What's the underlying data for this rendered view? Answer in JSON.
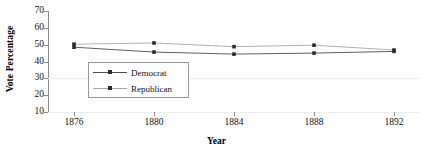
{
  "chart_data": {
    "type": "line",
    "title": "",
    "xlabel": "Year",
    "ylabel": "Vote Percentage",
    "x": [
      1876,
      1880,
      1884,
      1888,
      1892
    ],
    "categories": [
      "1876",
      "1880",
      "1884",
      "1888",
      "1892"
    ],
    "xtick_labels": [
      "1876",
      "1880",
      "1884",
      "1888",
      "1892"
    ],
    "ytick_labels": [
      "70",
      "60",
      "50",
      "40",
      "30",
      "20",
      "10"
    ],
    "ytick_values": [
      70,
      60,
      50,
      40,
      30,
      20,
      10
    ],
    "ylim": [
      10,
      70
    ],
    "xlim": [
      1874,
      1894
    ],
    "grid": "horizontal-faint",
    "legend_position": "inside-lower-left",
    "series": [
      {
        "name": "Democrat",
        "color": "#4d4d4d",
        "marker": "square",
        "values": [
          48.5,
          45.6,
          44.4,
          45.0,
          46.0
        ]
      },
      {
        "name": "Republican",
        "color": "#a8a8a8",
        "marker": "square",
        "values": [
          50.3,
          51.0,
          48.8,
          49.7,
          46.8
        ]
      }
    ]
  },
  "legend": {
    "items": [
      {
        "label": "Democrat"
      },
      {
        "label": "Republican"
      }
    ]
  },
  "axes": {
    "y_title": "Vote Percentage",
    "x_title": "Year"
  },
  "colors": {
    "democrat": "#4d4d4d",
    "republican": "#a8a8a8",
    "axis": "#8a8a8a",
    "grid": "#ededed",
    "text": "#111111",
    "background": "#ffffff"
  }
}
